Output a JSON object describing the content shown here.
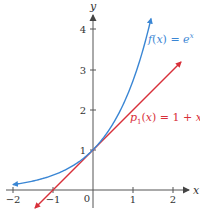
{
  "chart_data": {
    "type": "line",
    "title": "",
    "xlabel": "x",
    "ylabel": "y",
    "xlim": [
      -2.1,
      2.4
    ],
    "ylim": [
      -0.7,
      4.4
    ],
    "grid": false,
    "x_ticks": [
      -2,
      -1,
      0,
      1,
      2
    ],
    "x_tick_labels": [
      "−2",
      "−1",
      "0",
      "1",
      "2"
    ],
    "y_ticks": [
      1,
      2,
      3,
      4
    ],
    "y_tick_labels": [
      "1",
      "2",
      "3",
      "4"
    ],
    "series": [
      {
        "name": "f(x) = e^x",
        "label_text": "f(x) = e",
        "label_sup": "x",
        "color": "#3a86d4",
        "function": "exp(x)",
        "x_range": [
          -2,
          1.45
        ],
        "x": [
          -2,
          -1.5,
          -1,
          -0.5,
          0,
          0.5,
          1,
          1.25,
          1.45
        ],
        "y": [
          0.135,
          0.223,
          0.368,
          0.607,
          1.0,
          1.649,
          2.718,
          3.49,
          4.26
        ]
      },
      {
        "name": "p1(x) = 1 + x",
        "label_text": "p",
        "label_sub": "1",
        "label_rest": "(x) = 1 + x",
        "color": "#d8303a",
        "function": "1 + x",
        "x_range": [
          -1.55,
          2.2
        ],
        "x": [
          -1.55,
          -1,
          0,
          1,
          2,
          2.2
        ],
        "y": [
          -0.55,
          0,
          1,
          2,
          3,
          3.2
        ]
      }
    ],
    "annotations": [
      {
        "text": "f(x) = e^x",
        "near": [
          1.45,
          4.0
        ],
        "color": "#3a86d4"
      },
      {
        "text": "p1(x) = 1 + x",
        "near": [
          1.1,
          2.0
        ],
        "color": "#d8303a"
      }
    ]
  },
  "axes": {
    "x_label": "x",
    "y_label": "y",
    "origin_label": "0"
  },
  "colors": {
    "axis": "#555555",
    "exp_curve": "#3a86d4",
    "linear": "#d8303a"
  }
}
